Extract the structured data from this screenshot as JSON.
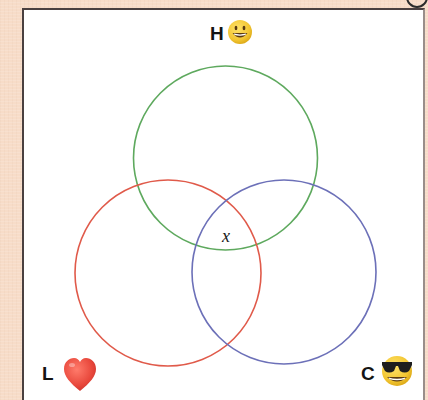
{
  "diagram": {
    "type": "venn",
    "sets": [
      {
        "id": "H",
        "label": "H",
        "emoji": "grinning-face",
        "color": "#5ea95e",
        "circle": {
          "cx": 225.5,
          "cy": 158,
          "r": 92
        }
      },
      {
        "id": "L",
        "label": "L",
        "emoji": "red-heart",
        "color": "#e05a4a",
        "circle": {
          "cx": 168,
          "cy": 273,
          "r": 93
        }
      },
      {
        "id": "C",
        "label": "C",
        "emoji": "smiling-face-with-sunglasses",
        "color": "#6c70b8",
        "circle": {
          "cx": 284,
          "cy": 272,
          "r": 92
        }
      }
    ],
    "regions": [
      {
        "sets": [
          "H",
          "L",
          "C"
        ],
        "label": "x"
      }
    ]
  },
  "labels": {
    "h": "H",
    "l": "L",
    "c": "C",
    "center": "x"
  },
  "colors": {
    "background": "#f7dcc8",
    "frame": "#ffffff",
    "frame_border": "#4a4040",
    "h_circle": "#5ea95e",
    "l_circle": "#e05a4a",
    "c_circle": "#6c70b8",
    "emoji_yellow": "#f2c531",
    "heart_red": "#e8473b"
  }
}
